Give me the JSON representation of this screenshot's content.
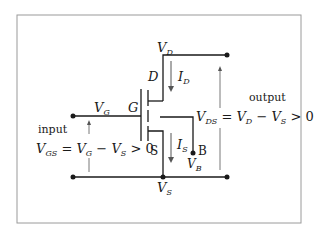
{
  "diagram": {
    "terminals": {
      "gate_letter": "G",
      "drain_letter": "D",
      "source_letter": "S",
      "body_letter": "B"
    },
    "node_labels": {
      "VD": {
        "main": "V",
        "sub": "D"
      },
      "VG": {
        "main": "V",
        "sub": "G"
      },
      "VS": {
        "main": "V",
        "sub": "S"
      },
      "VB": {
        "main": "V",
        "sub": "B"
      }
    },
    "currents": {
      "ID": {
        "main": "I",
        "sub": "D"
      },
      "IS": {
        "main": "I",
        "sub": "S"
      }
    },
    "input": {
      "label": "input",
      "equation": {
        "lhs": "V",
        "lhs_sub": "GS",
        "eq": " = ",
        "a": "V",
        "a_sub": "G",
        "minus": " − ",
        "b": "V",
        "b_sub": "S",
        "tail": " > 0"
      }
    },
    "output": {
      "label": "output",
      "equation": {
        "lhs": "V",
        "lhs_sub": "DS",
        "eq": " = ",
        "a": "V",
        "a_sub": "D",
        "minus": " − ",
        "b": "V",
        "b_sub": "S",
        "tail": " > 0"
      }
    },
    "colors": {
      "line": "#1a1a1a",
      "arrow": "#555555",
      "frame": "#9a9a9a"
    }
  }
}
